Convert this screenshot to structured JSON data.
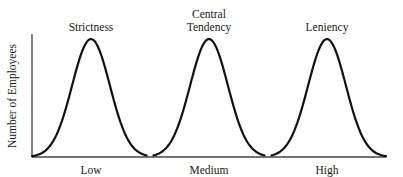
{
  "chart_data": {
    "type": "line",
    "title": "",
    "xlabel": "",
    "ylabel": "Number of Employees",
    "x_categories": [
      "Low",
      "Medium",
      "High"
    ],
    "x_range": [
      0,
      3
    ],
    "y_range": [
      0,
      1
    ],
    "grid": false,
    "legend": "none",
    "series": [
      {
        "name": "Strictness",
        "label_lines": [
          "Strictness"
        ],
        "distribution": "normal",
        "peak_x": 0.5,
        "peak_y": 1.0,
        "domain": [
          0,
          0.97
        ],
        "spread": 0.16
      },
      {
        "name": "Central Tendency",
        "label_lines": [
          "Central",
          "Tendency"
        ],
        "distribution": "normal",
        "peak_x": 1.5,
        "peak_y": 1.0,
        "domain": [
          1.03,
          1.97
        ],
        "spread": 0.16
      },
      {
        "name": "Leniency",
        "label_lines": [
          "Leniency"
        ],
        "distribution": "normal",
        "peak_x": 2.5,
        "peak_y": 1.0,
        "domain": [
          2.03,
          3.0
        ],
        "spread": 0.16
      }
    ]
  }
}
